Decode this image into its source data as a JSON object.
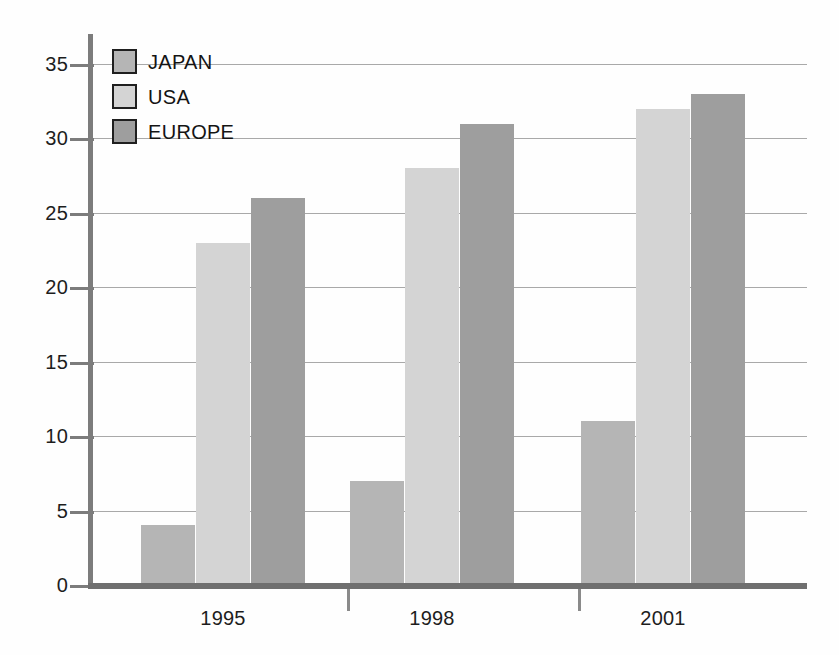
{
  "chart_data": {
    "type": "bar",
    "title": "",
    "subtitle": "",
    "xlabel": "",
    "ylabel": "",
    "categories": [
      "1995",
      "1998",
      "2001"
    ],
    "series": [
      {
        "name": "JAPAN",
        "values": [
          4,
          7,
          11
        ],
        "color": "#b5b5b5"
      },
      {
        "name": "USA",
        "values": [
          23,
          28,
          32
        ],
        "color": "#d4d4d4"
      },
      {
        "name": "EUROPE",
        "values": [
          26,
          31,
          33
        ],
        "color": "#9e9e9e"
      }
    ],
    "ylim": [
      0,
      35
    ],
    "ytick_labels": [
      "0",
      "5",
      "10",
      "15",
      "20",
      "25",
      "30",
      "35"
    ],
    "ytick_values": [
      0,
      5,
      10,
      15,
      20,
      25,
      30,
      35
    ],
    "grid": true,
    "grid_axis": "y",
    "legend_position": "top-left",
    "legend_entries": [
      "JAPAN",
      "USA",
      "EUROPE"
    ],
    "annotations": [],
    "axis_color": "#7c7c7c",
    "grid_color": "#9a9a9a",
    "background": "#fefefe"
  }
}
